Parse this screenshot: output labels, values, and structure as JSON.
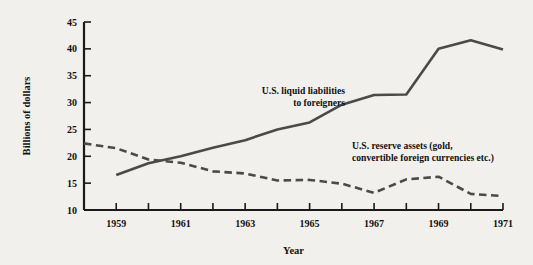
{
  "chart_data": {
    "type": "line",
    "title": "",
    "xlabel": "Year",
    "ylabel": "Billions of dollars",
    "xlim": [
      1958,
      1971
    ],
    "ylim": [
      10,
      45
    ],
    "ytick_values": [
      10,
      15,
      20,
      25,
      30,
      35,
      40,
      45
    ],
    "ytick_labels": [
      "10",
      "15",
      "20",
      "25",
      "30",
      "35",
      "40",
      "45"
    ],
    "xtick_values": [
      1958,
      1959,
      1960,
      1961,
      1962,
      1963,
      1964,
      1965,
      1966,
      1967,
      1968,
      1969,
      1970,
      1971
    ],
    "xtick_labels": [
      "",
      "1959",
      "",
      "1961",
      "",
      "1963",
      "",
      "1965",
      "",
      "1967",
      "",
      "1969",
      "",
      "1971"
    ],
    "grid": false,
    "legend_position": "inline-annotations",
    "series": [
      {
        "name": "U.S. liquid liabilities to foreigners",
        "style": "solid",
        "color": "#4a4a4a",
        "x": [
          1959,
          1960,
          1961,
          1962,
          1963,
          1964,
          1965,
          1966,
          1967,
          1968,
          1969,
          1970,
          1971
        ],
        "values": [
          16.5,
          18.7,
          20.0,
          21.6,
          23.0,
          25.0,
          26.3,
          29.6,
          31.4,
          31.5,
          40.0,
          41.6,
          39.9
        ]
      },
      {
        "name": "U.S. reserve assets (gold, convertible foreign currencies etc.)",
        "style": "dashed",
        "color": "#4a4a4a",
        "x": [
          1958,
          1959,
          1960,
          1961,
          1962,
          1963,
          1964,
          1965,
          1966,
          1967,
          1968,
          1969,
          1970,
          1971
        ],
        "values": [
          22.4,
          21.5,
          19.4,
          18.8,
          17.2,
          16.8,
          15.5,
          15.6,
          14.9,
          13.2,
          15.7,
          16.2,
          13.0,
          12.6
        ]
      }
    ],
    "annotations": [
      {
        "name": "liquid-liabilities-label",
        "lines": [
          "U.S. liquid liabilities",
          "to foreigners"
        ],
        "align": "right",
        "x_px": 345,
        "y_px": 94
      },
      {
        "name": "reserve-assets-label",
        "lines": [
          "U.S. reserve assets (gold,",
          "convertible foreign currencies etc.)"
        ],
        "align": "left",
        "x_px": 352,
        "y_px": 149
      }
    ]
  },
  "colors": {
    "background": "#f2f0ec",
    "axis": "#1a1a1a",
    "line": "#4a4a4a",
    "text": "#111111"
  }
}
